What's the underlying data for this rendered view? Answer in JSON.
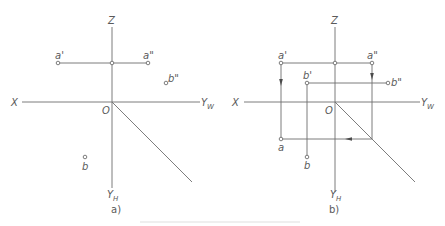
{
  "figure": {
    "caption": "",
    "panels": [
      {
        "id": "a",
        "sublabel": "a)",
        "axes": {
          "x_label": "X",
          "z_label": "Z",
          "yw_label": "Y",
          "yw_sub": "W",
          "yh_label": "Y",
          "yh_sub": "H",
          "origin_label": "O"
        },
        "points": {
          "a_front": "a'",
          "a_side": "a\"",
          "b_side": "b\"",
          "b_top": "b"
        }
      },
      {
        "id": "b",
        "sublabel": "b)",
        "axes": {
          "x_label": "X",
          "z_label": "Z",
          "yw_label": "Y",
          "yw_sub": "W",
          "yh_label": "Y",
          "yh_sub": "H",
          "origin_label": "O"
        },
        "points": {
          "a_front": "a'",
          "a_side": "a\"",
          "b_front": "b'",
          "b_side": "b\"",
          "a_top": "a",
          "b_top": "b"
        }
      }
    ],
    "colors": {
      "line": "#6e6e6e",
      "text": "#5a5a5a",
      "background": "#ffffff"
    }
  }
}
